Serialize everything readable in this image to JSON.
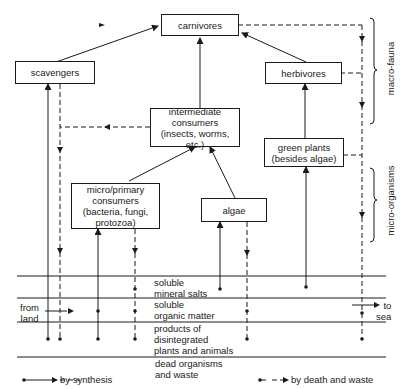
{
  "nodes": {
    "carnivores": "carnivores",
    "scavengers": "scavengers",
    "herbivores": "herbivores",
    "intermediate": [
      "intermediate",
      "consumers",
      "(insects, worms, etc.)"
    ],
    "green_plants": [
      "green plants",
      "(besides algae)"
    ],
    "micro_primary": [
      "micro/primary",
      "consumers",
      "(bacteria, fungi,",
      "protozoa)"
    ],
    "algae": "algae"
  },
  "brackets": {
    "macro": "macro-fauna",
    "micro": "micro-organisms"
  },
  "layers": {
    "mineral": [
      "soluble",
      "mineral salts"
    ],
    "organic": [
      "soluble",
      "organic matter"
    ],
    "products": [
      "products of",
      "disintegrated",
      "plants and animals"
    ],
    "dead": [
      "dead organisms",
      "and waste"
    ]
  },
  "flows": {
    "from_land": [
      "from",
      "land"
    ],
    "to_sea": [
      "to",
      "sea"
    ]
  },
  "legend": {
    "synthesis": "by synthesis",
    "death": "by death and waste"
  }
}
